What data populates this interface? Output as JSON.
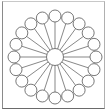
{
  "diagram": {
    "type": "radial-hub-spoke",
    "outer_node_count": 20,
    "stroke_color": "#555555",
    "fill_color": "#ffffff",
    "background": "#ffffff"
  }
}
